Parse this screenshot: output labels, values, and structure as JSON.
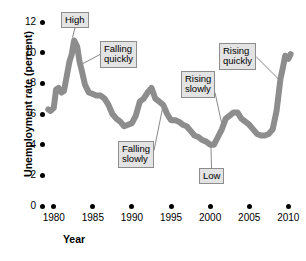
{
  "chart_data": {
    "type": "line",
    "title": "",
    "xlabel": "Year",
    "ylabel": "Unemployment rate (percent)",
    "xlim": [
      1979.2,
      2010.6
    ],
    "ylim": [
      0,
      12
    ],
    "xticks": [
      "1980",
      "1985",
      "1990",
      "1995",
      "2000",
      "2005",
      "2010"
    ],
    "xtick_values": [
      1980,
      1985,
      1990,
      1995,
      2000,
      2005,
      2010
    ],
    "yticks": [
      "0",
      "2",
      "4",
      "6",
      "8",
      "10",
      "12"
    ],
    "ytick_values": [
      0,
      2,
      4,
      6,
      8,
      10,
      12
    ],
    "grid": false,
    "legend": "none",
    "line_color": "#8d8d8d",
    "line_width_px": 6,
    "series": [
      {
        "name": "Unemployment rate",
        "x": [
          1979.3,
          1979.6,
          1980.0,
          1980.3,
          1980.6,
          1981.0,
          1981.3,
          1981.6,
          1982.0,
          1982.3,
          1982.6,
          1983.0,
          1983.3,
          1983.6,
          1984.0,
          1984.5,
          1985.0,
          1985.5,
          1986.0,
          1986.5,
          1987.0,
          1987.5,
          1988.0,
          1988.5,
          1989.0,
          1989.5,
          1990.0,
          1990.5,
          1991.0,
          1991.5,
          1992.0,
          1992.5,
          1993.0,
          1993.5,
          1994.0,
          1994.5,
          1995.0,
          1995.5,
          1996.0,
          1996.5,
          1997.0,
          1997.5,
          1998.0,
          1998.5,
          1999.0,
          1999.5,
          2000.0,
          2000.5,
          2001.0,
          2001.5,
          2002.0,
          2002.5,
          2003.0,
          2003.5,
          2004.0,
          2004.5,
          2005.0,
          2005.5,
          2006.0,
          2006.5,
          2007.0,
          2007.5,
          2008.0,
          2008.5,
          2009.0,
          2009.3,
          2009.6,
          2010.0,
          2010.3
        ],
        "y": [
          6.3,
          6.2,
          6.4,
          7.6,
          7.7,
          7.4,
          7.5,
          8.3,
          9.4,
          9.9,
          10.8,
          10.4,
          9.4,
          8.8,
          7.9,
          7.4,
          7.3,
          7.2,
          7.2,
          7.0,
          6.6,
          6.0,
          5.7,
          5.5,
          5.2,
          5.3,
          5.4,
          5.9,
          6.8,
          7.0,
          7.4,
          7.7,
          7.0,
          6.8,
          6.6,
          6.0,
          5.6,
          5.6,
          5.5,
          5.3,
          5.2,
          4.9,
          4.6,
          4.5,
          4.3,
          4.2,
          4.0,
          4.0,
          4.5,
          5.0,
          5.7,
          5.9,
          6.1,
          6.1,
          5.7,
          5.5,
          5.3,
          5.0,
          4.7,
          4.6,
          4.6,
          4.7,
          5.0,
          6.2,
          8.3,
          9.0,
          9.8,
          9.6,
          9.9
        ]
      }
    ],
    "annotations": [
      {
        "label": "High",
        "target_x": 1982.4,
        "target_y": 11.0
      },
      {
        "label": "Falling quickly",
        "target_x": 1983.4,
        "target_y": 9.2
      },
      {
        "label": "Falling slowly",
        "target_x": 1994.0,
        "target_y": 6.6
      },
      {
        "label": "Rising slowly",
        "target_x": 2001.6,
        "target_y": 5.1
      },
      {
        "label": "Low",
        "target_x": 2000.1,
        "target_y": 4.0
      },
      {
        "label": "Rising quickly",
        "target_x": 2008.9,
        "target_y": 8.2
      }
    ]
  }
}
